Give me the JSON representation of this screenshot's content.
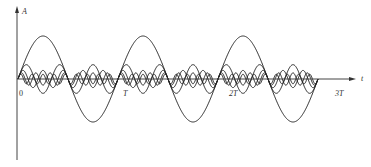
{
  "chart_data": {
    "type": "line",
    "title": "",
    "xlabel": "t",
    "ylabel": "A",
    "x_ticks": [
      "0",
      "T",
      "2T",
      "3T"
    ],
    "x_range_periods": [
      0,
      3
    ],
    "grid": false,
    "legend": null,
    "series": [
      {
        "name": "fundamental (n=1)",
        "harmonic": 1,
        "amplitude": 1.0
      },
      {
        "name": "3rd harmonic",
        "harmonic": 3,
        "amplitude": 0.333
      },
      {
        "name": "5th harmonic",
        "harmonic": 5,
        "amplitude": 0.2
      },
      {
        "name": "7th harmonic",
        "harmonic": 7,
        "amplitude": 0.143
      },
      {
        "name": "9th harmonic",
        "harmonic": 9,
        "amplitude": 0.111
      }
    ],
    "colors": {
      "curve": "#222222",
      "axis": "#444444"
    }
  },
  "layout": {
    "origin_x": 18,
    "baseline_y": 79,
    "period_px": 100,
    "unit_amp_px": 43,
    "axis_x_end": 353,
    "axis_y_top": 9,
    "axis_y_bottom": 160
  },
  "labels": {
    "y_axis": "A",
    "x_axis": "t",
    "origin": "0",
    "t1": "T",
    "t2": "2T",
    "t3": "3T"
  }
}
